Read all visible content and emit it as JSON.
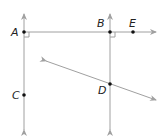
{
  "diagram": {
    "colors": {
      "line": "#a0a0a0",
      "point": "#111111",
      "label": "#222222",
      "background": "#ffffff"
    },
    "points": [
      {
        "id": "A",
        "label": "A",
        "x": 24,
        "y": 32
      },
      {
        "id": "B",
        "label": "B",
        "x": 110,
        "y": 32
      },
      {
        "id": "E",
        "label": "E",
        "x": 133,
        "y": 32
      },
      {
        "id": "C",
        "label": "C",
        "x": 24,
        "y": 95
      },
      {
        "id": "D",
        "label": "D",
        "x": 110,
        "y": 84
      }
    ],
    "lines": [
      {
        "name": "line-AC",
        "through": [
          "A",
          "C"
        ],
        "type": "vertical"
      },
      {
        "name": "line-BD",
        "through": [
          "B",
          "D"
        ],
        "type": "vertical"
      },
      {
        "name": "ray-AE",
        "through": [
          "A",
          "B",
          "E"
        ],
        "type": "horizontal"
      },
      {
        "name": "transversal-D",
        "through": [
          "D"
        ],
        "type": "diagonal"
      }
    ],
    "right_angles": [
      "A",
      "B"
    ]
  }
}
